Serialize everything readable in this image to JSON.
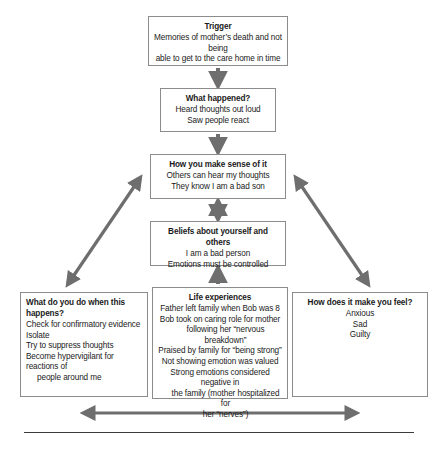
{
  "diagram": {
    "type": "cbt-formulation-flow-diagram",
    "arrow_color": "#6e6e6e",
    "border_color": "#8c8c8c",
    "text_color": "#1a1a1a",
    "boxes": {
      "trigger": {
        "title": "Trigger",
        "lines": [
          "Memories of mother’s death and not being",
          "able to get to the care home in time"
        ]
      },
      "what_happened": {
        "title": "What happened?",
        "lines": [
          "Heard thoughts out loud",
          "Saw people react"
        ]
      },
      "sense": {
        "title": "How you make sense of it",
        "lines": [
          "Others can hear my thoughts",
          "They know I am a bad son"
        ]
      },
      "beliefs": {
        "title": "Beliefs about yourself and others",
        "lines": [
          "I am a bad person",
          "Emotions must be controlled"
        ]
      },
      "behaviour": {
        "title": "What do you do when this happens?",
        "lines": [
          "Check for confirmatory evidence",
          "Isolate",
          "Try to suppress thoughts",
          "Become hypervigilant for reactions of"
        ],
        "indented_lines": [
          "people around me"
        ]
      },
      "life_experiences": {
        "title": "Life experiences",
        "lines": [
          "Father left family when Bob was 8",
          "Bob took on caring role for mother"
        ],
        "lines_2": [
          "following her “nervous breakdown”"
        ],
        "lines_3": [
          "Praised by family for “being strong”",
          "Not showing emotion was valued",
          "Strong emotions considered negative in"
        ],
        "lines_4": [
          "the family (mother hospitalized for",
          "her “nerves”)"
        ]
      },
      "feelings": {
        "title": "How does it make you feel?",
        "lines": [
          "Anxious",
          "Sad",
          "Guilty"
        ]
      }
    },
    "connectors": [
      {
        "name": "trigger-to-what-happened",
        "direction": "down"
      },
      {
        "name": "what-happened-to-sense",
        "direction": "down"
      },
      {
        "name": "sense-to-beliefs",
        "direction": "both"
      },
      {
        "name": "life-experiences-to-beliefs",
        "direction": "up"
      },
      {
        "name": "sense-to-behaviour",
        "direction": "both"
      },
      {
        "name": "sense-to-feelings",
        "direction": "both"
      },
      {
        "name": "behaviour-to-feelings",
        "direction": "both"
      }
    ]
  }
}
